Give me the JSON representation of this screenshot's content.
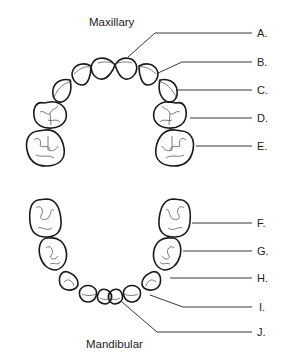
{
  "diagram": {
    "title_upper": "Maxillary",
    "title_lower": "Mandibular",
    "labels": {
      "A": "A.",
      "B": "B.",
      "C": "C.",
      "D": "D.",
      "E": "E.",
      "F": "F.",
      "G": "G.",
      "H": "H.",
      "I": "I.",
      "J": "J."
    },
    "colors": {
      "stroke": "#1a1a1a",
      "background": "#ffffff"
    }
  }
}
